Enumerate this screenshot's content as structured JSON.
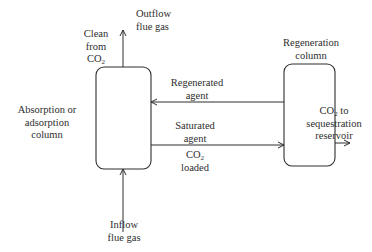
{
  "diagram": {
    "type": "process-flow",
    "colors": {
      "stroke": "#2e2e2e",
      "background": "#ffffff",
      "text": "#2e2e2e"
    },
    "nodes": {
      "absorption_column": {
        "label_lines": [
          "Absorption or",
          "adsorption",
          "column"
        ]
      },
      "regeneration_column": {
        "label_lines": [
          "Regeneration",
          "column"
        ]
      }
    },
    "flows": {
      "outflow": {
        "label_lines": [
          "Outflow",
          "flue gas"
        ]
      },
      "clean": {
        "label_lines": [
          "Clean",
          "from",
          "CO",
          "2"
        ]
      },
      "inflow": {
        "label_lines": [
          "Inflow",
          "flue gas"
        ]
      },
      "regenerated_agent": {
        "label_lines": [
          "Regenerated",
          "agent"
        ]
      },
      "saturated_agent": {
        "label_lines": [
          "Saturated",
          "agent"
        ]
      },
      "co2_loaded": {
        "label_lines": [
          "CO",
          "2",
          "loaded"
        ]
      },
      "co2_to_reservoir": {
        "label_lines": [
          "CO",
          "2",
          " to",
          "sequestration",
          "reservoir"
        ]
      }
    }
  }
}
